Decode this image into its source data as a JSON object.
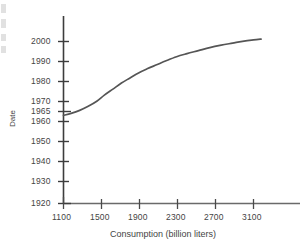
{
  "chart_data": {
    "type": "line",
    "title": "",
    "xlabel": "Consumption (billion liters)",
    "ylabel": "Date",
    "xlim": [
      1020,
      3300
    ],
    "ylim": [
      1920,
      2006
    ],
    "grid": false,
    "legend": null,
    "xticks": [
      "1100",
      "1500",
      "1900",
      "2300",
      "2700",
      "3100"
    ],
    "xtick_values": [
      1100,
      1500,
      1900,
      2300,
      2700,
      3100
    ],
    "yticks": [
      "1920",
      "1930",
      "1940",
      "1950",
      "1960",
      "1965",
      "1970",
      "1980",
      "1990",
      "2000"
    ],
    "ytick_values": [
      1920,
      1930,
      1940,
      1950,
      1960,
      1965,
      1970,
      1980,
      1990,
      2000
    ],
    "series": [
      {
        "name": "Consumption over time",
        "color": "#555555",
        "x": [
          1100,
          1180,
          1270,
          1360,
          1450,
          1530,
          1620,
          1710,
          1800,
          1890,
          1980,
          2080,
          2180,
          2290,
          2400,
          2520,
          2640,
          2760,
          2880,
          3000,
          3100,
          3180
        ],
        "y": [
          1963.5,
          1964.5,
          1966.0,
          1968.0,
          1970.5,
          1973.5,
          1976.5,
          1979.5,
          1982.0,
          1984.5,
          1986.5,
          1988.5,
          1990.5,
          1992.5,
          1994.0,
          1995.5,
          1997.0,
          1998.2,
          1999.2,
          2000.2,
          2000.8,
          2001.2
        ]
      }
    ]
  },
  "axes": {
    "x_axis_label": "Consumption (billion liters)",
    "y_axis_label": "Date"
  }
}
